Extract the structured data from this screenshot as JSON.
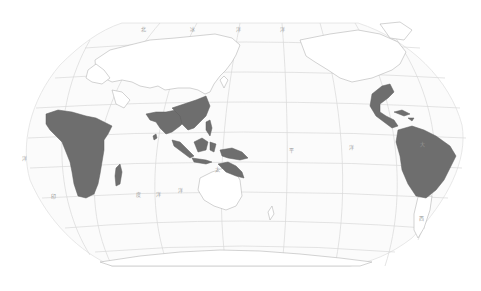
{
  "map": {
    "type": "world-map",
    "projection": "pacific-centered pseudo-cylindrical",
    "colors": {
      "highlight": "#6e6e6e",
      "land": "#ffffff",
      "graticule": "#d9d9d9",
      "background": "#ffffff"
    },
    "highlighted_regions": [
      "Sub-Saharan Africa",
      "Madagascar",
      "South Asia",
      "Southern China",
      "Southeast Asia",
      "Indonesia",
      "New Guinea",
      "Northern Australia",
      "Mexico",
      "Central America",
      "Caribbean",
      "Northern South America"
    ],
    "ocean_labels": [
      {
        "text": "印",
        "x": 51,
        "y": 198
      },
      {
        "text": "度",
        "x": 136,
        "y": 196
      },
      {
        "text": "洋",
        "x": 156,
        "y": 196
      },
      {
        "text": "洋",
        "x": 178,
        "y": 192
      },
      {
        "text": "太",
        "x": 215,
        "y": 171
      },
      {
        "text": "平",
        "x": 289,
        "y": 152
      },
      {
        "text": "洋",
        "x": 349,
        "y": 149
      },
      {
        "text": "大",
        "x": 420,
        "y": 146
      },
      {
        "text": "西",
        "x": 419,
        "y": 220
      },
      {
        "text": "洋",
        "x": 22,
        "y": 160
      },
      {
        "text": "北",
        "x": 141,
        "y": 31
      },
      {
        "text": "冰",
        "x": 190,
        "y": 31
      },
      {
        "text": "洋",
        "x": 236,
        "y": 31
      },
      {
        "text": "洋",
        "x": 280,
        "y": 31
      }
    ]
  }
}
